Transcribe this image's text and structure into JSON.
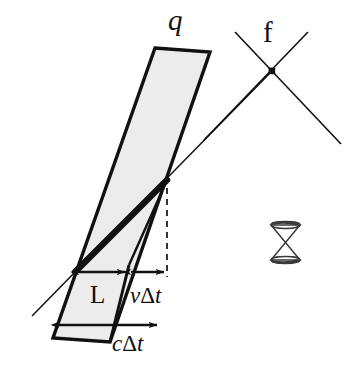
{
  "figure": {
    "background_color": "#ffffff",
    "slab_fill_color": "#ececec",
    "stroke_color": "#111111"
  },
  "labels": {
    "q": "q",
    "f": "f",
    "L": "L",
    "v_delta_t": {
      "symbol": "v",
      "delta": "Δ",
      "t": "t"
    },
    "c_delta_t": {
      "symbol": "c",
      "delta": "Δ",
      "t": "t"
    }
  },
  "elements": {
    "slab_name": "shaded-parallelogram",
    "thick_diagonal_name": "light-ray-thick-diagonal",
    "thin_worldline_name": "thin-worldline",
    "crossing_marker_name": "crossing-point-dot",
    "dashed_line_name": "vertical-dashed-line",
    "bowtie_name": "bowtie-hourglass-glyph",
    "x_lines_name": "x-crossing-lines"
  },
  "dimension_arrows": [
    {
      "name": "arrow-L",
      "label": "L",
      "x_start": 77,
      "x_end": 127,
      "y": 272,
      "double_headed": true
    },
    {
      "name": "arrow-v-delta-t",
      "label": "vΔt",
      "x_start": 127,
      "x_end": 167,
      "y": 272,
      "double_headed": true
    },
    {
      "name": "arrow-c-delta-t",
      "label": "cΔt",
      "x_start": 57,
      "x_end": 160,
      "y": 325,
      "double_headed": true
    }
  ],
  "geometry": {
    "slab_points": "155,48 210,52 110,342 53,338",
    "slab_inner_line": "127,271 110,342",
    "thick_diagonal": {
      "x1": 75,
      "y1": 272,
      "x2": 167,
      "y2": 180
    },
    "thin_worldline": {
      "x1": 32,
      "y1": 316,
      "x2": 272,
      "y2": 71
    },
    "dashed_vertical": {
      "x1": 167,
      "y1": 178,
      "x2": 167,
      "y2": 276
    },
    "x_line_a": {
      "x1": 235,
      "y1": 32,
      "x2": 340,
      "y2": 143
    },
    "x_line_b": {
      "x1": 307,
      "y1": 32,
      "x2": 204,
      "y2": 139
    },
    "crossing_point": {
      "cx": 272,
      "cy": 71,
      "r": 3.1
    },
    "bowtie_box": {
      "x": 268,
      "y": 222,
      "w": 34,
      "h": 42
    }
  }
}
